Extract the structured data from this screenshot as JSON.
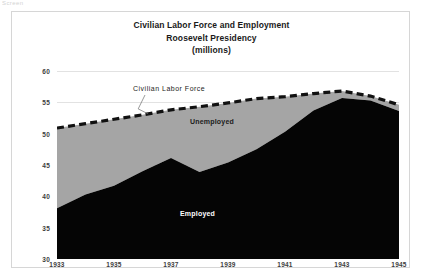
{
  "top_artifact": "Screen",
  "chart_data": {
    "type": "area",
    "title_lines": [
      "Civilian Labor Force and Employment",
      "Roosevelt Presidency",
      "(millions)"
    ],
    "title": "Civilian Labor Force and Employment Roosevelt Presidency (millions)",
    "xlabel": "",
    "ylabel": "",
    "ylim": [
      30,
      60
    ],
    "xlim": [
      1933,
      1945
    ],
    "grid": true,
    "legend_position": "inline-annotations",
    "x": [
      1933,
      1934,
      1935,
      1936,
      1937,
      1938,
      1939,
      1940,
      1941,
      1942,
      1943,
      1944,
      1945
    ],
    "categories": [
      "1933",
      "1934",
      "1935",
      "1936",
      "1937",
      "1938",
      "1939",
      "1940",
      "1941",
      "1942",
      "1943",
      "1944",
      "1945"
    ],
    "xticks": [
      "1933",
      "1935",
      "1937",
      "1939",
      "1941",
      "1943",
      "1945"
    ],
    "yticks": [
      "30",
      "35",
      "40",
      "45",
      "50",
      "55",
      "60"
    ],
    "series": [
      {
        "name": "Civilian Labor Force",
        "values": [
          50.9,
          51.6,
          52.3,
          53.0,
          53.8,
          54.3,
          54.9,
          55.6,
          55.9,
          56.4,
          56.8,
          56.0,
          54.6
        ],
        "style": "dashed-line",
        "color": "#111111"
      },
      {
        "name": "Unemployed",
        "values": [
          12.8,
          11.3,
          10.6,
          9.0,
          7.7,
          10.4,
          9.5,
          8.1,
          5.6,
          2.7,
          1.1,
          0.7,
          1.0
        ],
        "style": "filled-band",
        "color": "#a5a5a5"
      },
      {
        "name": "Employed",
        "values": [
          38.1,
          40.3,
          41.7,
          44.0,
          46.1,
          43.9,
          45.4,
          47.5,
          50.3,
          53.7,
          55.7,
          55.3,
          53.6
        ],
        "style": "filled-area",
        "color": "#050505"
      }
    ],
    "annotations": [
      {
        "text": "Civilian Labor Force",
        "target_series": "Civilian Labor Force",
        "target_x": 1936.2
      },
      {
        "text": "Unemployed",
        "target_series": "Unemployed"
      },
      {
        "text": "Employed",
        "target_series": "Employed"
      }
    ]
  }
}
